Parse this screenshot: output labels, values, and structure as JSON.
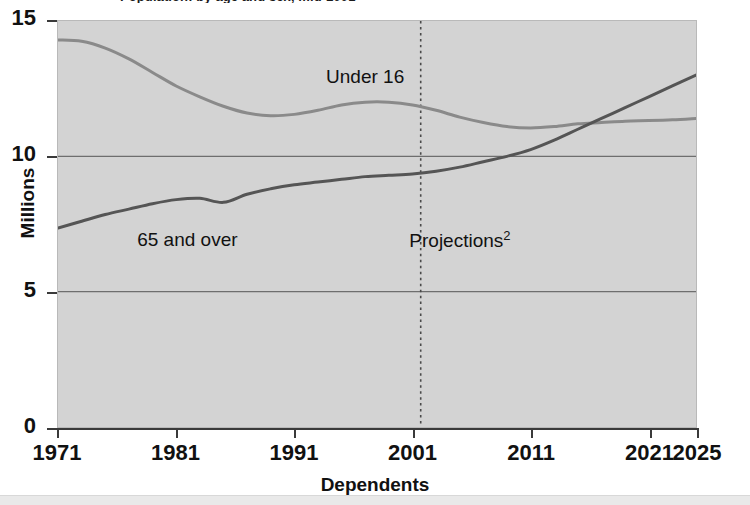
{
  "title_clipped": "Population: by age and sex, mid-2001",
  "chart_data": {
    "type": "line",
    "title": "",
    "xlabel": "Dependents",
    "ylabel": "Millions",
    "xlim": [
      1971,
      2025
    ],
    "ylim": [
      0,
      15
    ],
    "yticks": [
      "0",
      "5",
      "10",
      "15"
    ],
    "ytick_values": [
      0,
      5,
      10,
      15
    ],
    "xticks": [
      "1971",
      "1981",
      "1991",
      "2001",
      "2011",
      "2021",
      "2025"
    ],
    "xtick_values": [
      1971,
      1981,
      1991,
      2001,
      2011,
      2021,
      2025
    ],
    "grid": "horizontal",
    "legend": "inline-annotations",
    "annotations": [
      {
        "text": "Under 16",
        "x": 1997,
        "y": 12.9
      },
      {
        "text": "65 and over",
        "x": 1982,
        "y": 6.9
      },
      {
        "text": "Projections",
        "superscript": "2",
        "x": 2005,
        "y": 6.9
      }
    ],
    "projection_divider": {
      "x": 2001.7,
      "style": "dotted",
      "label": "Projections"
    },
    "series": [
      {
        "name": "Under 16",
        "color": "#8a8a8a",
        "x": [
          1971,
          1973,
          1975,
          1977,
          1979,
          1981,
          1983,
          1985,
          1987,
          1989,
          1991,
          1993,
          1995,
          1997,
          1999,
          2001,
          2003,
          2005,
          2007,
          2009,
          2011,
          2013,
          2015,
          2017,
          2019,
          2021,
          2023,
          2025
        ],
        "values": [
          14.3,
          14.25,
          14.0,
          13.6,
          13.1,
          12.6,
          12.2,
          11.85,
          11.6,
          11.5,
          11.55,
          11.7,
          11.9,
          12.0,
          12.0,
          11.9,
          11.7,
          11.45,
          11.25,
          11.1,
          11.05,
          11.1,
          11.2,
          11.25,
          11.3,
          11.32,
          11.35,
          11.4
        ]
      },
      {
        "name": "65 and over",
        "color": "#555555",
        "x": [
          1971,
          1973,
          1975,
          1977,
          1979,
          1981,
          1983,
          1985,
          1987,
          1989,
          1991,
          1993,
          1995,
          1997,
          1999,
          2001,
          2003,
          2005,
          2007,
          2009,
          2011,
          2013,
          2015,
          2017,
          2019,
          2021,
          2023,
          2025
        ],
        "values": [
          7.35,
          7.6,
          7.85,
          8.05,
          8.25,
          8.4,
          8.45,
          8.3,
          8.6,
          8.8,
          8.95,
          9.05,
          9.15,
          9.25,
          9.3,
          9.35,
          9.45,
          9.6,
          9.8,
          10.0,
          10.25,
          10.6,
          11.0,
          11.4,
          11.8,
          12.2,
          12.6,
          13.0
        ]
      }
    ]
  },
  "colors": {
    "plot_background": "#d3d3d3",
    "page_background": "#ffffff",
    "axis": "#3a3a3a",
    "gridline": "#6e6e6e",
    "under16": "#8a8a8a",
    "over65": "#555555",
    "text": "#111111"
  }
}
